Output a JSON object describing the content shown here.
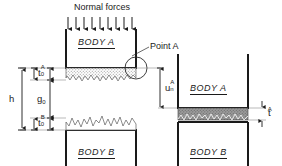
{
  "figure": {
    "title_note": "Contact between two rough bodies: initial (left) and deformed (right) configurations",
    "normal_forces_label": "Normal forces",
    "point_a_label": "Point A",
    "arrow_count": 9,
    "colors": {
      "line": "#1a1a1a",
      "thin_line": "#555555",
      "asperity_fill_left": "#b9b9b9",
      "asperity_fill_right": "#8a8a8a",
      "background": "#ffffff"
    }
  },
  "left_panel": {
    "body_a_label": "BODY A",
    "body_b_label": "BODY B",
    "dimensions": {
      "h": {
        "symbol": "h",
        "sub": "",
        "sup": ""
      },
      "t0A": {
        "symbol": "t",
        "sub": "0",
        "sup": "A"
      },
      "g0": {
        "symbol": "g",
        "sub": "0",
        "sup": ""
      },
      "t0B": {
        "symbol": "t",
        "sub": "0",
        "sup": "B"
      }
    }
  },
  "right_panel": {
    "body_a_label": "BODY A",
    "body_b_label": "BODY B",
    "dimensions": {
      "unA": {
        "symbol": "u",
        "sub": "n",
        "sup": "A"
      },
      "tA": {
        "symbol": "t",
        "sub": "",
        "sup": "A"
      }
    }
  }
}
